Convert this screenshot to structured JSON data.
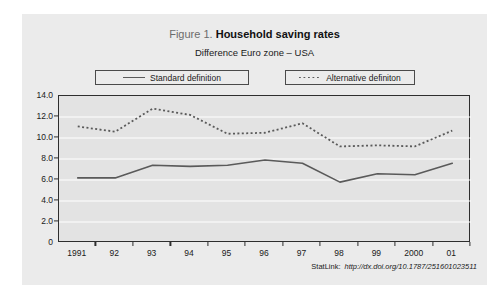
{
  "figure": {
    "label": "Figure 1.",
    "title": "Household saving rates",
    "subtitle": "Difference Euro zone – USA"
  },
  "legend": {
    "standard_label": "Standard definition",
    "alternative_label": "Alternative definiton"
  },
  "footer": {
    "statlink_label": "StatLink:",
    "statlink_url": "http://dx.doi.org/10.1787/251601023511"
  },
  "colors": {
    "panel_background": "#ebebeb",
    "plot_background": "#e3e3e3",
    "axis": "#2e2e2e",
    "gridline": "#ffffff",
    "series_standard": "#5a5a5a",
    "series_alternative": "#5a5a5a",
    "text": "#1a1a1a",
    "figure_label": "#6b6b6b"
  },
  "chart_data": {
    "type": "line",
    "title": "Figure 1. Household saving rates",
    "subtitle": "Difference Euro zone – USA",
    "xlabel": "",
    "ylabel": "",
    "categories": [
      "1991",
      "92",
      "93",
      "94",
      "95",
      "96",
      "97",
      "98",
      "99",
      "2000",
      "01"
    ],
    "ytick_labels": [
      "14.0",
      "12.0",
      "10.0",
      "8.0",
      "6.0",
      "4.0",
      "2.0",
      "0"
    ],
    "ytick_values": [
      14,
      12,
      10,
      8,
      6,
      4,
      2,
      0
    ],
    "ylim": [
      0,
      14
    ],
    "grid": true,
    "legend_position": "above-plot",
    "series": [
      {
        "name": "Standard definition",
        "style": "solid",
        "values": [
          6.2,
          6.2,
          7.4,
          7.3,
          7.4,
          7.9,
          7.6,
          5.8,
          6.6,
          6.5,
          7.6
        ]
      },
      {
        "name": "Alternative definiton",
        "style": "dotted",
        "values": [
          11.1,
          10.6,
          12.8,
          12.2,
          10.4,
          10.5,
          11.4,
          9.2,
          9.3,
          9.2,
          10.7
        ]
      }
    ]
  }
}
